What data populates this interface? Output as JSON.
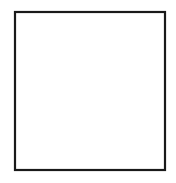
{
  "figure": {
    "title": "Static electricity: charged balloon attracting hair",
    "frame": {
      "x": 14,
      "y": 11,
      "width": 152,
      "height": 160,
      "border_color": "#1a1a1a",
      "background_color": "#ffffff"
    },
    "colors": {
      "outline": "#1a1a1a",
      "balloon_fill": "#d8d8d8",
      "hair_fill": "#9a9a9a",
      "arm_fill": "#9a9a9a",
      "skin_fill": "#ffffff",
      "charge_fill": "#ffffff",
      "page_background": "#ffffff"
    }
  },
  "balloon": {
    "label": "balloon",
    "center_x": 124,
    "center_y": 62,
    "radius_x": 41,
    "radius_y": 46,
    "fill": "#d8d8d8",
    "knot": {
      "x": 110,
      "y": 108,
      "label": "balloon-knot"
    },
    "string": {
      "from_x": 110,
      "from_y": 110,
      "to_x": 72,
      "to_y": 152,
      "label": "balloon-string"
    },
    "charges": [
      {
        "sign": "−",
        "type": "negative",
        "x": 113,
        "y": 42,
        "r": 10
      },
      {
        "sign": "+",
        "type": "positive",
        "x": 131,
        "y": 41,
        "r": 10
      },
      {
        "sign": "−",
        "type": "negative",
        "x": 147,
        "y": 58,
        "r": 10
      },
      {
        "sign": "−",
        "type": "negative",
        "x": 133,
        "y": 76,
        "r": 11
      },
      {
        "sign": "−",
        "type": "negative",
        "x": 110,
        "y": 86,
        "r": 10
      },
      {
        "sign": "+",
        "type": "positive",
        "x": 128,
        "y": 94,
        "r": 10
      }
    ]
  },
  "hair": {
    "label": "hair-standing-up",
    "fill": "#9a9a9a",
    "strand_count": 13,
    "charges": [
      {
        "sign": "+",
        "type": "positive",
        "x": 64,
        "y": 98,
        "r": 11
      },
      {
        "sign": "+",
        "type": "positive",
        "x": 58,
        "y": 140,
        "r": 11
      }
    ]
  },
  "arm": {
    "label": "arm-holding-string",
    "fill": "#9a9a9a"
  },
  "legend": {
    "negative_symbol": "−",
    "positive_symbol": "+",
    "negative_name": "negative-charge",
    "positive_name": "positive-charge"
  }
}
